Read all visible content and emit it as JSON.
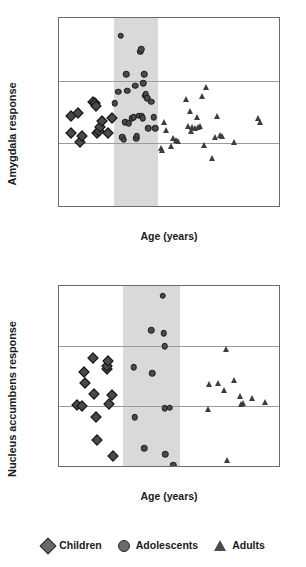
{
  "legend": {
    "items": [
      {
        "label": "Children",
        "marker": "diamond-marker-icon",
        "color": "#6a6a6a"
      },
      {
        "label": "Adolescents",
        "marker": "circle-marker-icon",
        "color": "#6a6a6a"
      },
      {
        "label": "Adults",
        "marker": "triangle-marker-icon",
        "color": "#4a4a4a"
      }
    ]
  },
  "chart_data": [
    {
      "type": "scatter",
      "title": "",
      "xlabel": "Age (years)",
      "ylabel": "Amygdala response",
      "xlim": [
        5,
        35
      ],
      "ylim": [
        -0.5,
        1
      ],
      "xticks": [
        5,
        10,
        15,
        20,
        25,
        30,
        35
      ],
      "yticks": [
        1,
        0.5,
        0,
        -0.5
      ],
      "ytick_labels": [
        "1",
        "0.5",
        "0",
        "-0.5"
      ],
      "xtick_labels": [
        "5",
        "10",
        "15",
        "20",
        "25",
        "30",
        "35"
      ],
      "grid": "horizontal-at-0.5-and-0",
      "gridlines": [
        0.5,
        0
      ],
      "legend_position": "below-figure",
      "highlight_band": {
        "x_start": 12.5,
        "x_end": 18.5,
        "color": "#d9d9d9"
      },
      "series": [
        {
          "name": "Children",
          "marker": "diamond",
          "points": [
            [
              6.6,
              0.22
            ],
            [
              6.7,
              0.08
            ],
            [
              7.6,
              0.24
            ],
            [
              7.8,
              0.01
            ],
            [
              8.2,
              0.06
            ],
            [
              9.7,
              0.33
            ],
            [
              9.9,
              0.32
            ],
            [
              10.0,
              0.3
            ],
            [
              10.2,
              0.08
            ],
            [
              10.4,
              0.1
            ],
            [
              10.6,
              0.13
            ],
            [
              10.9,
              0.18
            ],
            [
              11.7,
              0.08
            ],
            [
              12.2,
              0.2
            ]
          ]
        },
        {
          "name": "Adolescents",
          "marker": "circle",
          "points": [
            [
              12.6,
              0.32
            ],
            [
              13.1,
              0.41
            ],
            [
              13.4,
              0.86
            ],
            [
              13.6,
              0.05
            ],
            [
              13.8,
              0.03
            ],
            [
              14.0,
              0.17
            ],
            [
              14.2,
              0.55
            ],
            [
              14.3,
              0.42
            ],
            [
              14.5,
              0.16
            ],
            [
              14.9,
              0.2
            ],
            [
              15.2,
              0.21
            ],
            [
              15.4,
              0.46
            ],
            [
              15.5,
              0.04
            ],
            [
              15.6,
              0.06
            ],
            [
              15.9,
              0.22
            ],
            [
              16.1,
              0.73
            ],
            [
              16.2,
              0.75
            ],
            [
              16.3,
              0.22
            ],
            [
              16.4,
              0.2
            ],
            [
              16.5,
              0.48
            ],
            [
              16.6,
              0.55
            ],
            [
              16.7,
              0.38
            ],
            [
              16.8,
              0.39
            ],
            [
              17.0,
              0.36
            ],
            [
              17.2,
              0.12
            ],
            [
              17.6,
              0.33
            ],
            [
              17.9,
              0.21
            ],
            [
              18.1,
              0.12
            ]
          ]
        },
        {
          "name": "Adults",
          "marker": "triangle",
          "points": [
            [
              18.9,
              -0.04
            ],
            [
              19.1,
              -0.05
            ],
            [
              19.3,
              0.17
            ],
            [
              19.6,
              0.11
            ],
            [
              20.3,
              -0.02
            ],
            [
              20.6,
              0.04
            ],
            [
              21.0,
              0.03
            ],
            [
              21.2,
              0.02
            ],
            [
              22.3,
              0.35
            ],
            [
              22.6,
              0.14
            ],
            [
              22.8,
              0.26
            ],
            [
              23.0,
              0.1
            ],
            [
              23.2,
              0.13
            ],
            [
              23.5,
              0.12
            ],
            [
              23.8,
              0.21
            ],
            [
              24.0,
              0.13
            ],
            [
              24.2,
              0.14
            ],
            [
              24.5,
              0.38
            ],
            [
              24.8,
              -0.01
            ],
            [
              25.1,
              0.45
            ],
            [
              25.8,
              -0.12
            ],
            [
              26.3,
              0.05
            ],
            [
              26.5,
              0.22
            ],
            [
              26.9,
              0.07
            ],
            [
              27.2,
              0.06
            ],
            [
              28.9,
              0.01
            ],
            [
              32.1,
              0.2
            ],
            [
              32.4,
              0.17
            ]
          ]
        }
      ]
    },
    {
      "type": "scatter",
      "title": "",
      "xlabel": "Age (years)",
      "ylabel": "Nucleus accumbens response",
      "xlim": [
        5,
        30
      ],
      "ylim": [
        -1,
        2
      ],
      "xticks": [
        5,
        10,
        15,
        20,
        25,
        30
      ],
      "yticks": [
        2,
        1,
        0,
        -1
      ],
      "ytick_labels": [
        "2",
        "1",
        "0",
        "-1"
      ],
      "xtick_labels": [
        "5",
        "10",
        "15",
        "20",
        "25",
        "30"
      ],
      "grid": "horizontal-at-1-and-0",
      "gridlines": [
        1,
        0
      ],
      "legend_position": "below-figure",
      "highlight_band": {
        "x_start": 12.3,
        "x_end": 18.8,
        "color": "#d9d9d9"
      },
      "series": [
        {
          "name": "Children",
          "marker": "diamond",
          "points": [
            [
              7.0,
              0.01
            ],
            [
              7.6,
              0.0
            ],
            [
              7.8,
              0.56
            ],
            [
              7.9,
              0.39
            ],
            [
              8.9,
              0.8
            ],
            [
              9.0,
              0.2
            ],
            [
              9.2,
              -0.18
            ],
            [
              9.3,
              -0.56
            ],
            [
              10.4,
              0.62
            ],
            [
              10.5,
              0.67
            ],
            [
              10.6,
              0.75
            ],
            [
              10.7,
              0.03
            ],
            [
              11.0,
              0.19
            ],
            [
              11.1,
              -0.84
            ]
          ]
        },
        {
          "name": "Adolescents",
          "marker": "circle",
          "points": [
            [
              13.5,
              0.65
            ],
            [
              13.6,
              -0.19
            ],
            [
              14.7,
              -0.7
            ],
            [
              15.5,
              1.26
            ],
            [
              15.6,
              0.55
            ],
            [
              16.8,
              1.84
            ],
            [
              16.9,
              1.21
            ],
            [
              17.0,
              1.0
            ],
            [
              17.0,
              -0.04
            ],
            [
              17.1,
              -0.8
            ],
            [
              17.6,
              -0.03
            ],
            [
              18.0,
              -0.99
            ]
          ]
        },
        {
          "name": "Adults",
          "marker": "triangle",
          "points": [
            [
              21.9,
              -0.05
            ],
            [
              22.0,
              0.37
            ],
            [
              23.1,
              0.39
            ],
            [
              23.7,
              0.26
            ],
            [
              24.0,
              0.95
            ],
            [
              24.1,
              -0.9
            ],
            [
              24.9,
              0.43
            ],
            [
              25.6,
              0.16
            ],
            [
              25.7,
              0.04
            ],
            [
              25.9,
              0.05
            ],
            [
              26.9,
              0.14
            ],
            [
              28.4,
              0.06
            ]
          ]
        }
      ]
    }
  ]
}
